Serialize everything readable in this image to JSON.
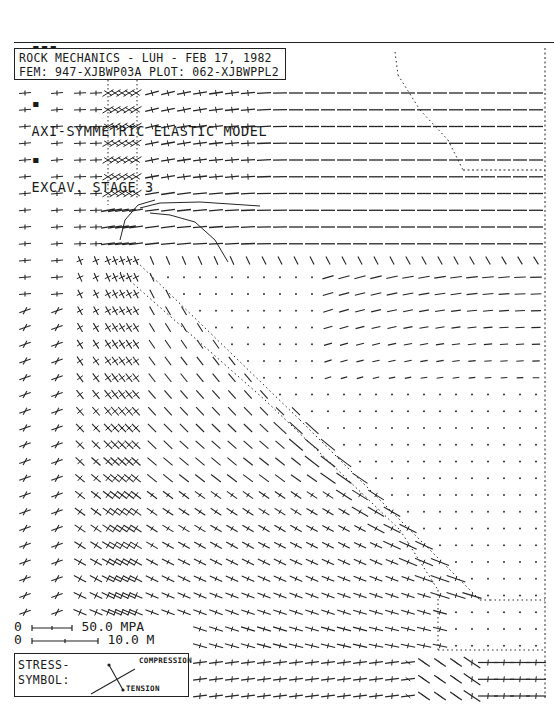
{
  "header": {
    "marks": "▪▪▪",
    "program": "WP-CAVE",
    "sep1": "▪",
    "title": "AXI-SYMMETRIC ELASTIC MODEL",
    "sep2": "▪",
    "stage": "EXCAV. STAGE 3"
  },
  "info_box": {
    "line1": "ROCK MECHANICS - LUH - FEB 17, 1982",
    "line2": "FEM: 947-XJBWP03A  PLOT: 062-XJBWPPL2"
  },
  "scale": {
    "stress_zero": "0",
    "stress_label": "50.0 MPA",
    "length_zero": "0",
    "length_label": "10.0 M"
  },
  "legend": {
    "title_line1": "STRESS-",
    "title_line2": "SYMBOL:",
    "compression_label": "COMPRESSION",
    "tension_label": "TENSION"
  },
  "chart_data": {
    "type": "stress-tensor field plot",
    "subtitle": "ROCK MECHANICS - LUH - FEB 17, 1982 / FEM: 947-XJBWP03A PLOT: 062-XJBWPPL2",
    "scale_bars": [
      {
        "label": "50.0 MPA",
        "quantity": "stress"
      },
      {
        "label": "10.0 M",
        "quantity": "length"
      }
    ],
    "legend": [
      "COMPRESSION (long bar)",
      "TENSION (bar with dot ends)"
    ],
    "grid": {
      "row_start_y": 93,
      "row_step": 16.75,
      "rows": 37,
      "columns_x": [
        25,
        57,
        80,
        96,
        108,
        115,
        122,
        129,
        136,
        152,
        168,
        184,
        200,
        216,
        232,
        248,
        264,
        280,
        296,
        312,
        328,
        344,
        360,
        376,
        392,
        408,
        424,
        440,
        456,
        472,
        488,
        504,
        520,
        536
      ]
    },
    "boundaries": {
      "right_axis_x": 545,
      "cave_upper_outline": [
        [
          395,
          52
        ],
        [
          398,
          75
        ],
        [
          420,
          110
        ],
        [
          448,
          140
        ],
        [
          463,
          170
        ]
      ],
      "cave_upper_floor": [
        [
          463,
          170
        ],
        [
          545,
          170
        ]
      ],
      "inner_shaft_left_x": 108,
      "inner_shaft_right_x": 137,
      "inner_shaft_y": [
        75,
        170
      ],
      "diagonal_outer": [
        [
          137,
          262
        ],
        [
          300,
          420
        ],
        [
          480,
          600
        ],
        [
          490,
          600
        ],
        [
          545,
          600
        ]
      ],
      "diagonal_inner": [
        [
          120,
          272
        ],
        [
          265,
          400
        ],
        [
          400,
          530
        ],
        [
          438,
          590
        ],
        [
          438,
          650
        ],
        [
          545,
          650
        ]
      ]
    },
    "regions": [
      {
        "name": "far-field compression (upper right)",
        "symbol": "horizontal bars"
      },
      {
        "name": "excavated cavity (lower right)",
        "symbol": "dots (near-zero stress)"
      },
      {
        "name": "pillar / abutment zone (left)",
        "symbol": "crosses"
      },
      {
        "name": "transition band (diagonal)",
        "symbol": "inclined bars"
      }
    ]
  }
}
